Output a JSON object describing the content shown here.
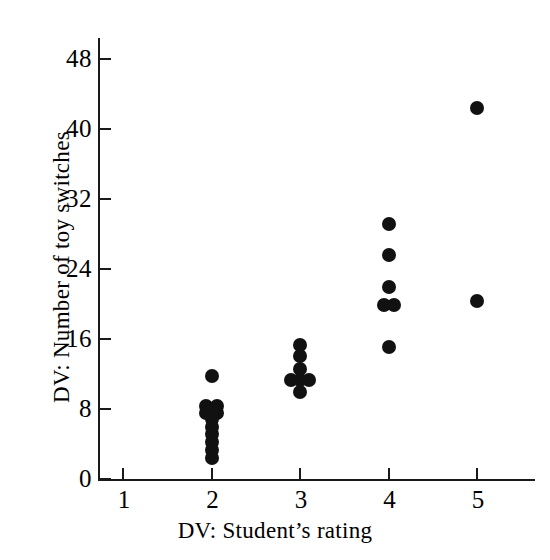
{
  "chart_data": {
    "type": "scatter",
    "title": "",
    "subtitle": "",
    "xlabel": "DV:  Student’s rating",
    "ylabel": "DV:  Number of toy switches",
    "xlim": [
      0.5,
      5.5
    ],
    "ylim": [
      0,
      52
    ],
    "grid": false,
    "legend": null,
    "xticks": [
      1,
      2,
      3,
      4,
      5
    ],
    "xtick_labels": [
      "1",
      "2",
      "3",
      "4",
      "5"
    ],
    "yticks": [
      0,
      8,
      16,
      24,
      32,
      40,
      48
    ],
    "ytick_labels": [
      "0",
      "8",
      "16",
      "24",
      "32",
      "40",
      "48"
    ],
    "marker": "filled-circle",
    "marker_color": "#111111",
    "points": [
      {
        "x": 2,
        "y": 11.8
      },
      {
        "x": 1.94,
        "y": 8.3
      },
      {
        "x": 2.06,
        "y": 8.3
      },
      {
        "x": 1.94,
        "y": 7.6
      },
      {
        "x": 2.06,
        "y": 7.6
      },
      {
        "x": 2.0,
        "y": 7.9
      },
      {
        "x": 2.0,
        "y": 6.9
      },
      {
        "x": 2.0,
        "y": 6.0
      },
      {
        "x": 2.0,
        "y": 5.1
      },
      {
        "x": 2.0,
        "y": 4.2
      },
      {
        "x": 2.0,
        "y": 3.3
      },
      {
        "x": 2.0,
        "y": 2.4
      },
      {
        "x": 3.0,
        "y": 15.3
      },
      {
        "x": 3.0,
        "y": 14.1
      },
      {
        "x": 3.0,
        "y": 12.6
      },
      {
        "x": 2.9,
        "y": 11.3
      },
      {
        "x": 3.0,
        "y": 11.3
      },
      {
        "x": 3.1,
        "y": 11.3
      },
      {
        "x": 3.0,
        "y": 9.9
      },
      {
        "x": 4.0,
        "y": 29.1
      },
      {
        "x": 4.0,
        "y": 25.6
      },
      {
        "x": 4.0,
        "y": 22.0
      },
      {
        "x": 3.95,
        "y": 19.9
      },
      {
        "x": 4.06,
        "y": 19.9
      },
      {
        "x": 4.0,
        "y": 15.1
      },
      {
        "x": 5.0,
        "y": 42.4
      },
      {
        "x": 5.0,
        "y": 20.3
      }
    ]
  },
  "axes": {
    "x_title": "DV:  Student’s rating",
    "y_title": "DV:  Number of toy switches",
    "x_tick_labels": [
      "1",
      "2",
      "3",
      "4",
      "5"
    ],
    "y_tick_labels": [
      "0",
      "8",
      "16",
      "24",
      "32",
      "40",
      "48"
    ],
    "axis_color": "#1a1a1a"
  }
}
